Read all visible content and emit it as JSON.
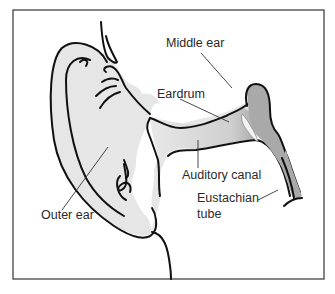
{
  "diagram": {
    "colors": {
      "outer_fill": "#e6e6e6",
      "middle_ear_fill": "#a9a9a9",
      "eardrum_fill": "#f4f4f4",
      "outline": "#111111",
      "frame": "#444444",
      "background": "#ffffff"
    },
    "labels": {
      "middle_ear": "Middle ear",
      "eardrum": "Eardrum",
      "auditory_canal": "Auditory canal",
      "eustachian_tube_line1": "Eustachian",
      "eustachian_tube_line2": "tube",
      "outer_ear": "Outer ear"
    }
  }
}
